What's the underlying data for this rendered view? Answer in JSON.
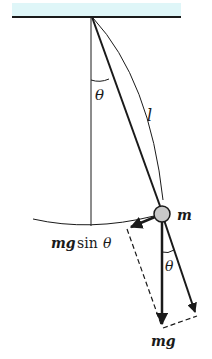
{
  "diagram": {
    "colors": {
      "ceiling": "#dff6f8",
      "line": "#1a1a1a",
      "bob": "#c8c8c8"
    },
    "labels": {
      "theta_top": "θ",
      "length": "l",
      "mass": "m",
      "restoring_force_mg": "mg",
      "restoring_force_sin": "sin",
      "restoring_force_theta": "θ",
      "theta_bottom": "θ",
      "weight": "mg"
    }
  }
}
